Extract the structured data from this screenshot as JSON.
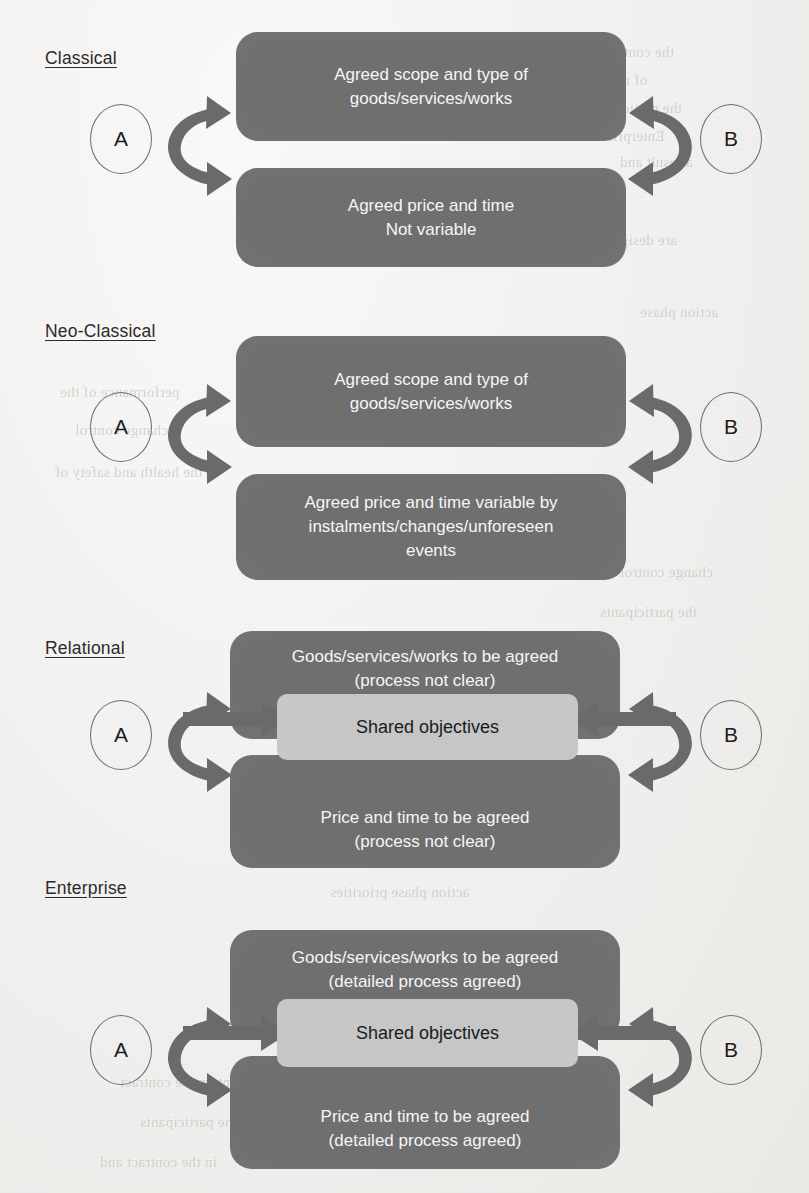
{
  "diagram": {
    "title_semantics": "Contract relationship typology diagram",
    "colors": {
      "dark_box": "#6f6f6f",
      "light_box": "#c6c6c6",
      "arrow": "#6a6a6a",
      "text_on_dark": "#f6f6f6",
      "text_on_light": "#1b1b1b",
      "page_background": "#f2f1ef",
      "label_text": "#2b2b2b"
    },
    "party_left_label": "A",
    "party_right_label": "B",
    "sections": [
      {
        "id": "classical",
        "label": "Classical",
        "boxes": [
          {
            "id": "classical-scope",
            "tone": "dark",
            "text": "Agreed scope and type of\ngoods/services/works"
          },
          {
            "id": "classical-price",
            "tone": "dark",
            "text": "Agreed price and time\nNot variable"
          }
        ],
        "shared_objectives": null,
        "has_straight_arrows": false
      },
      {
        "id": "neo-classical",
        "label": "Neo-Classical",
        "boxes": [
          {
            "id": "neoclassical-scope",
            "tone": "dark",
            "text": "Agreed scope and type of\ngoods/services/works"
          },
          {
            "id": "neoclassical-price",
            "tone": "dark",
            "text": "Agreed price and time variable by\ninstalments/changes/unforeseen\nevents"
          }
        ],
        "shared_objectives": null,
        "has_straight_arrows": false
      },
      {
        "id": "relational",
        "label": "Relational",
        "boxes": [
          {
            "id": "relational-goods",
            "tone": "dark",
            "text": "Goods/services/works to be agreed\n(process not clear)"
          },
          {
            "id": "relational-price",
            "tone": "dark",
            "text": "Price and time to be agreed\n(process not clear)"
          }
        ],
        "shared_objectives": "Shared objectives",
        "has_straight_arrows": true
      },
      {
        "id": "enterprise",
        "label": "Enterprise",
        "boxes": [
          {
            "id": "enterprise-goods",
            "tone": "dark",
            "text": "Goods/services/works to be agreed\n(detailed process agreed)"
          },
          {
            "id": "enterprise-price",
            "tone": "dark",
            "text": "Price and time to be agreed\n(detailed process agreed)"
          }
        ],
        "shared_objectives": "Shared objectives",
        "has_straight_arrows": true
      }
    ],
    "icons": {
      "left_curved_double_arrow": "curved-double-arrow-left-icon",
      "right_curved_double_arrow": "curved-double-arrow-right-icon",
      "straight_arrow_right": "straight-arrow-right-icon",
      "straight_arrow_left": "straight-arrow-left-icon"
    },
    "ghost_text_lines": [
      "the contract",
      "of making the",
      "the participants",
      "Enterprise",
      "a result and",
      "are designed",
      "performance of the",
      "change control",
      "the health and safety of",
      "action phase priorities"
    ]
  }
}
